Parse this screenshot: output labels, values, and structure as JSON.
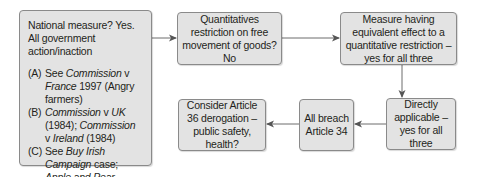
{
  "diagram": {
    "nodes": {
      "national_measure": {
        "lead": "National measure? Yes. All government action/inaction",
        "items": [
          {
            "label": "(A)",
            "parts": [
              {
                "t": "See "
              },
              {
                "t": "Commission",
                "i": true
              },
              {
                "t": " v "
              },
              {
                "t": "France",
                "i": true
              },
              {
                "t": " 1997 (Angry farmers)"
              }
            ]
          },
          {
            "label": "(B)",
            "parts": [
              {
                "t": "Commission",
                "i": true
              },
              {
                "t": " v "
              },
              {
                "t": "UK",
                "i": true
              },
              {
                "t": " (1984); "
              },
              {
                "t": "Commission",
                "i": true
              },
              {
                "t": " v "
              },
              {
                "t": "Ireland",
                "i": true
              },
              {
                "t": " (1984)"
              }
            ]
          },
          {
            "label": "(C)",
            "parts": [
              {
                "t": "See "
              },
              {
                "t": "Buy Irish Campaign",
                "i": true
              },
              {
                "t": " case; "
              },
              {
                "t": "Apple and Pear Development Council",
                "i": true
              },
              {
                "t": " v "
              },
              {
                "t": "KJ Lewis Ltd",
                "i": true
              },
              {
                "t": " (1983)"
              }
            ]
          }
        ]
      },
      "quantitative_restriction": "Quantitatives restriction on free movement of goods? No",
      "meqr": "Measure having equivalent effect to a quantitative restriction – yes for all three",
      "directly_applicable": "Directly applicable – yes for all three",
      "all_breach": "All breach Article 34",
      "article36": "Consider Article 36 derogation – public safety, health?"
    },
    "edges": [
      {
        "from": "national_measure",
        "to": "quantitative_restriction"
      },
      {
        "from": "quantitative_restriction",
        "to": "meqr"
      },
      {
        "from": "meqr",
        "to": "directly_applicable"
      },
      {
        "from": "directly_applicable",
        "to": "all_breach"
      },
      {
        "from": "all_breach",
        "to": "article36"
      }
    ],
    "colors": {
      "box_fill": "#e3e3e3",
      "box_border": "#8a8a8a",
      "line": "#6d6d6d"
    }
  }
}
